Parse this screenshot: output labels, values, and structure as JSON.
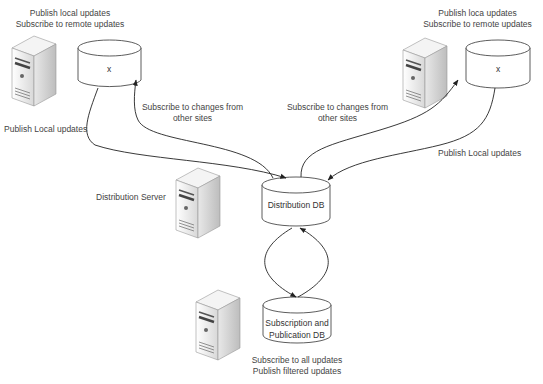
{
  "nodes": {
    "site_left": {
      "db_label": "x",
      "caption_line1": "Publish local updates",
      "caption_line2": "Subscribe to remote updates"
    },
    "site_right": {
      "db_label": "x",
      "caption_line1": "Publish loca updates",
      "caption_line2": "Subscribe to remote updates"
    },
    "distribution_db": {
      "label": "Distribution DB"
    },
    "distribution_server": {
      "label": "Distribution Server"
    },
    "subscription_db": {
      "label_line1": "Subscription and",
      "label_line2": "Publication DB",
      "caption_line1": "Subscribe to all updates",
      "caption_line2": "Publish filtered updates"
    }
  },
  "edges": {
    "left_publish": "Publish Local updates",
    "left_subscribe_line1": "Subscribe to changes from",
    "left_subscribe_line2": "other sites",
    "right_subscribe_line1": "Subscribe to changes from",
    "right_subscribe_line2": "other sites",
    "right_publish": "Publish Local updates"
  },
  "colors": {
    "line": "#222222",
    "db_fill": "#ffffff",
    "server_light": "#f2f2f2",
    "server_dark": "#7a7a7a"
  }
}
